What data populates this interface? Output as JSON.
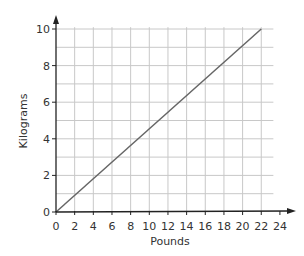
{
  "chart_data": {
    "type": "line",
    "title": "",
    "xlabel": "Pounds",
    "ylabel": "Kilograms",
    "xlim": [
      0,
      24
    ],
    "ylim": [
      0,
      10
    ],
    "x_ticks": [
      0,
      2,
      4,
      6,
      8,
      10,
      12,
      14,
      16,
      18,
      20,
      22,
      24
    ],
    "y_ticks": [
      0,
      2,
      4,
      6,
      8,
      10
    ],
    "grid": true,
    "grid_x_step": 2,
    "grid_y_step": 1,
    "legend": null,
    "series": [
      {
        "name": "Pounds to Kilograms",
        "x": [
          0,
          22
        ],
        "y": [
          0,
          10
        ]
      }
    ]
  },
  "colors": {
    "grid": "#c8c8c8",
    "axis": "#222222",
    "line": "#666666",
    "text": "#333333"
  }
}
